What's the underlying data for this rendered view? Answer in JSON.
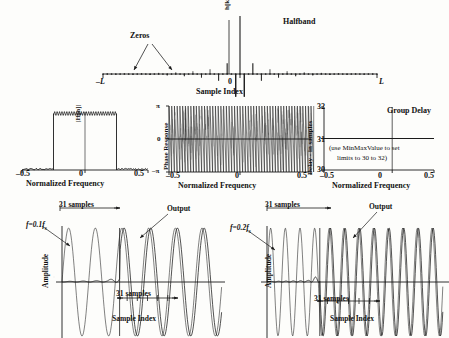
{
  "figure": {
    "background_color": "#fdfdfb",
    "ink_color": "#1a1a1a"
  },
  "panels": {
    "impulse": {
      "title": "Halfband",
      "annotation_zeros": "Zeros",
      "ylabel": "h[k]",
      "xlabel": "Sample Index",
      "xtick_left": "–L",
      "xtick_center": "0",
      "xtick_right": "L"
    },
    "magnitude": {
      "ylabel": "|H[n]|",
      "xlabel": "Normalized Frequency",
      "xticks": [
        "–0.5",
        "0",
        "0.5"
      ]
    },
    "phase": {
      "ylabel": "Phase Response",
      "xlabel": "Normalized Frequency",
      "yticks": [
        "π",
        "0",
        "–π"
      ],
      "xticks": [
        "–0.5",
        "0",
        "0.5"
      ]
    },
    "delay": {
      "title": "Group Delay",
      "ylabel": "Delay - in samples",
      "xlabel": "Normalized Frequency",
      "yticks": [
        "32",
        "31",
        "30"
      ],
      "xticks": [
        "–0.5",
        "0",
        "0.5"
      ],
      "note_line1": "(use MinMaxValue to set",
      "note_line2": "limits  to 30 to 32)"
    },
    "time_left": {
      "input_label": "f=0.1f",
      "input_label_sub": "s",
      "output_label": "Output",
      "span_top": "31 samples",
      "span_bottom": "31 samples",
      "ylabel": "Amplitude",
      "xlabel": "Sample Index"
    },
    "time_right": {
      "input_label": "f=0.2f",
      "input_label_sub": "s",
      "output_label": "Output",
      "span_top": "31 samples",
      "span_bottom": "31 samples",
      "ylabel": "Amplitude",
      "xlabel": "Sample Index"
    }
  },
  "chart_data": [
    {
      "type": "line",
      "name": "halfband-impulse-response",
      "title": "Halfband",
      "xlabel": "Sample Index",
      "ylabel": "h[k]",
      "xlim": [
        -32,
        32
      ],
      "ylim": [
        -0.12,
        0.55
      ],
      "grid": false,
      "legend": "none",
      "annotations": [
        "Zeros"
      ],
      "x": [
        -32,
        -31,
        -30,
        -29,
        -28,
        -27,
        -26,
        -25,
        -24,
        -23,
        -22,
        -21,
        -20,
        -19,
        -18,
        -17,
        -16,
        -15,
        -14,
        -13,
        -12,
        -11,
        -10,
        -9,
        -8,
        -7,
        -6,
        -5,
        -4,
        -3,
        -2,
        -1,
        0,
        1,
        2,
        3,
        4,
        5,
        6,
        7,
        8,
        9,
        10,
        11,
        12,
        13,
        14,
        15,
        16,
        17,
        18,
        19,
        20,
        21,
        22,
        23,
        24,
        25,
        26,
        27,
        28,
        29,
        30,
        31,
        32
      ],
      "values": [
        0,
        0.002,
        0,
        -0.003,
        0,
        0.004,
        0,
        -0.005,
        0,
        0.006,
        0,
        -0.008,
        0,
        0.01,
        0,
        -0.012,
        0,
        0.015,
        0,
        -0.019,
        0,
        0.024,
        0,
        -0.031,
        0,
        0.041,
        0,
        -0.058,
        0,
        0.093,
        0,
        -0.196,
        0.5,
        -0.196,
        0,
        0.093,
        0,
        -0.058,
        0,
        0.041,
        0,
        -0.031,
        0,
        0.024,
        0,
        -0.019,
        0,
        0.015,
        0,
        -0.012,
        0,
        0.01,
        0,
        -0.008,
        0,
        0.006,
        0,
        -0.005,
        0,
        0.004,
        0,
        -0.003,
        0,
        0.002,
        0
      ]
    },
    {
      "type": "line",
      "name": "magnitude-response",
      "xlabel": "Normalized Frequency",
      "ylabel": "|H[n]|",
      "xlim": [
        -0.5,
        0.5
      ],
      "ylim": [
        0,
        1.15
      ],
      "grid": false,
      "passband": [
        -0.25,
        0.25
      ],
      "passband_level": 1.0,
      "stopband_level": 0.0,
      "ripple_peak_to_peak": 0.06
    },
    {
      "type": "line",
      "name": "phase-response",
      "xlabel": "Normalized Frequency",
      "ylabel": "Phase Response",
      "xlim": [
        -0.5,
        0.5
      ],
      "ylim": [
        -3.14159,
        3.14159
      ],
      "yticks": [
        3.14159,
        0,
        -3.14159
      ],
      "ytick_labels": [
        "π",
        "0",
        "–π"
      ],
      "grid": false,
      "description": "linear phase wrapping sawtooth, dense over full band"
    },
    {
      "type": "line",
      "name": "group-delay",
      "title": "Group Delay",
      "xlabel": "Normalized Frequency",
      "ylabel": "Delay - in samples",
      "xlim": [
        -0.5,
        0.5
      ],
      "ylim": [
        30,
        32
      ],
      "yticks": [
        30,
        31,
        32
      ],
      "grid": false,
      "values_constant": 31,
      "annotation": "(use MinMaxValue to set limits  to 30 to 32)"
    },
    {
      "type": "line",
      "name": "time-response-0p1fs",
      "xlabel": "Sample Index",
      "ylabel": "Amplitude",
      "input_frequency": "0.1 fs",
      "delay_samples": 31,
      "series": [
        {
          "name": "Input",
          "description": "sinusoid at 0.1 fs, amplitude 1, starts at sample 0"
        },
        {
          "name": "Output",
          "description": "filtered sinusoid, zero for first 31 samples then full amplitude"
        }
      ]
    },
    {
      "type": "line",
      "name": "time-response-0p2fs",
      "xlabel": "Sample Index",
      "ylabel": "Amplitude",
      "input_frequency": "0.2 fs",
      "delay_samples": 31,
      "series": [
        {
          "name": "Input",
          "description": "sinusoid at 0.2 fs, amplitude 1, starts at sample 0"
        },
        {
          "name": "Output",
          "description": "filtered sinusoid, zero for first 31 samples then full amplitude"
        }
      ]
    }
  ]
}
